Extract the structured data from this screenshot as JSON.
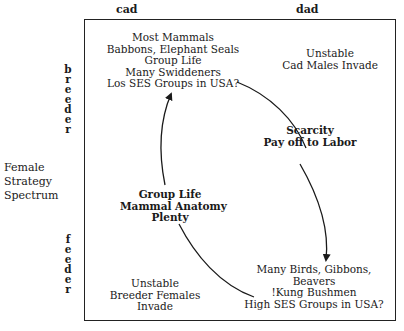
{
  "diagram": {
    "columns": [
      {
        "label": "cad"
      },
      {
        "label": "dad"
      }
    ],
    "rows": [
      {
        "label": "breeder",
        "letters": [
          "b",
          "r",
          "e",
          "e",
          "d",
          "e",
          "r"
        ]
      },
      {
        "label": "feeder",
        "letters": [
          "f",
          "e",
          "e",
          "d",
          "e",
          "r"
        ]
      }
    ],
    "side_label": [
      "Female",
      "Strategy",
      "Spectrum"
    ],
    "quadrants": {
      "cad_breeder": [
        "Most Mammals",
        "Babbons, Elephant Seals",
        "Group Life",
        "Many Swiddeners",
        "Los SES Groups in USA?"
      ],
      "dad_breeder": [
        "Unstable",
        "Cad Males Invade"
      ],
      "cad_feeder": [
        "Unstable",
        "Breeder Females",
        "Invade"
      ],
      "dad_feeder": [
        "Many Birds, Gibbons,",
        "Beavers",
        "!Kung Bushmen",
        "High SES Groups in USA?"
      ]
    },
    "transitions": {
      "scarcity": [
        "Scarcity",
        "Pay off to Labor"
      ],
      "plenty": [
        "Group Life",
        "Mammal Anatomy",
        "Plenty"
      ]
    },
    "line_color": "#1a1a1a"
  }
}
